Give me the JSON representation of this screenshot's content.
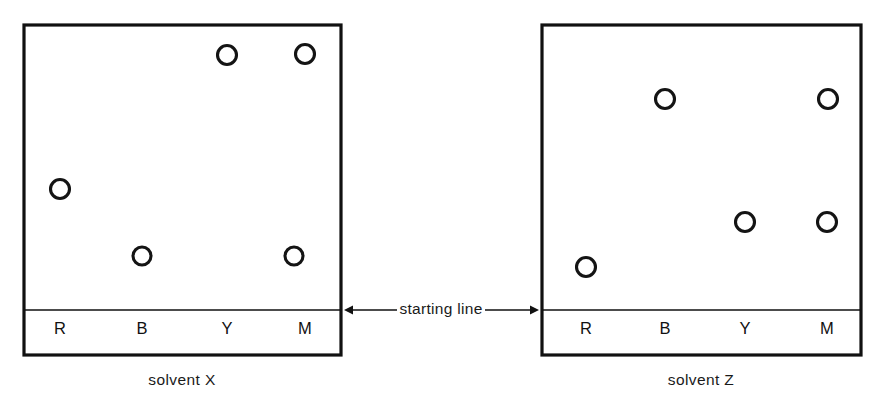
{
  "figure": {
    "annotation": {
      "label": "starting line",
      "icon_left": "left-arrow-icon",
      "icon_right": "right-arrow-icon"
    },
    "lane_labels": [
      "R",
      "B",
      "Y",
      "M"
    ],
    "colors": {
      "ink": "#111111",
      "background": "#ffffff",
      "spot_fill": "#ffffff"
    }
  },
  "chart_data": {
    "type": "scatter",
    "xlabel": "",
    "ylabel": "distance travelled from starting line",
    "grid": false,
    "legend": "none",
    "lanes": [
      "R",
      "B",
      "Y",
      "M"
    ],
    "lane_meaning": {
      "R": "red",
      "B": "blue",
      "Y": "yellow",
      "M": "mixture"
    },
    "panels": [
      {
        "name": "solvent X",
        "caption": "solvent X",
        "starting_line_label": "starting line",
        "plate": {
          "x": 24,
          "y": 25,
          "width": 317,
          "height": 330
        },
        "starting_line_y": 310,
        "spots": [
          {
            "lane": "R",
            "cx": 60,
            "cy": 189,
            "r": 9.5,
            "rf": 0.425
          },
          {
            "lane": "B",
            "cx": 142,
            "cy": 256,
            "r": 9.0,
            "rf": 0.189
          },
          {
            "lane": "Y",
            "cx": 227,
            "cy": 55,
            "r": 9.5,
            "rf": 0.895
          },
          {
            "lane": "M",
            "cx": 305,
            "cy": 54,
            "r": 9.5,
            "rf": 0.898
          },
          {
            "lane": "M",
            "cx": 294,
            "cy": 256,
            "r": 9.0,
            "rf": 0.189
          }
        ],
        "lane_label_positions": [
          {
            "label": "R",
            "x": 60,
            "y": 330
          },
          {
            "label": "B",
            "x": 142,
            "y": 330
          },
          {
            "label": "Y",
            "x": 227,
            "y": 330
          },
          {
            "label": "M",
            "x": 305,
            "y": 330
          }
        ]
      },
      {
        "name": "solvent Z",
        "caption": "solvent Z",
        "starting_line_label": "starting line",
        "plate": {
          "x": 542,
          "y": 25,
          "width": 319,
          "height": 330
        },
        "starting_line_y": 310,
        "spots": [
          {
            "lane": "R",
            "cx": 586,
            "cy": 267,
            "r": 9.5,
            "rf": 0.151
          },
          {
            "lane": "B",
            "cx": 665,
            "cy": 99,
            "r": 9.5,
            "rf": 0.741
          },
          {
            "lane": "Y",
            "cx": 745,
            "cy": 222,
            "r": 9.5,
            "rf": 0.309
          },
          {
            "lane": "M",
            "cx": 827,
            "cy": 222,
            "r": 9.5,
            "rf": 0.309
          },
          {
            "lane": "M",
            "cx": 828,
            "cy": 99,
            "r": 9.5,
            "rf": 0.741
          }
        ],
        "lane_label_positions": [
          {
            "label": "R",
            "x": 586,
            "y": 330
          },
          {
            "label": "B",
            "x": 665,
            "y": 330
          },
          {
            "label": "Y",
            "x": 745,
            "y": 330
          },
          {
            "label": "M",
            "x": 827,
            "y": 330
          }
        ]
      }
    ],
    "captions": [
      {
        "text": "solvent X",
        "x": 182,
        "y": 381
      },
      {
        "text": "solvent Z",
        "x": 701,
        "y": 381
      }
    ],
    "annotation": {
      "text": "starting line",
      "x": 441,
      "y": 310,
      "left_target_x": 344,
      "right_target_x": 539
    }
  }
}
